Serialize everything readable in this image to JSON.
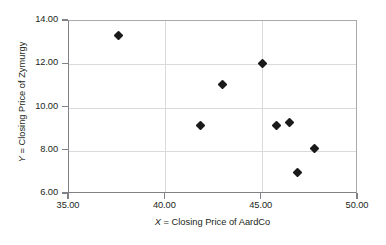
{
  "chart_data": {
    "type": "scatter",
    "title": "",
    "xlabel": "X = Closing Price of AardCo",
    "ylabel": "Y = Closing Price of Zymurgy",
    "xlabel_var": "X",
    "xlabel_rest": " = Closing Price of AardCo",
    "ylabel_var": "Y",
    "ylabel_rest": " = Closing Price of Zymurgy",
    "xlim": [
      35.0,
      50.0
    ],
    "ylim": [
      6.0,
      14.0
    ],
    "xticks": [
      35.0,
      40.0,
      45.0,
      50.0
    ],
    "yticks": [
      6.0,
      8.0,
      10.0,
      12.0,
      14.0
    ],
    "xtick_labels": [
      "35.00",
      "40.00",
      "45.00",
      "50.00"
    ],
    "ytick_labels": [
      "6.00",
      "8.00",
      "10.00",
      "12.00",
      "14.00"
    ],
    "grid": true,
    "grid_axis": "both",
    "legend": false,
    "marker": "diamond",
    "marker_color": "#1a1a1a",
    "grid_color": "#d9dadb",
    "axis_color": "#808285",
    "background": "#ffffff",
    "points": [
      {
        "x": 37.6,
        "y": 13.3
      },
      {
        "x": 41.9,
        "y": 9.1
      },
      {
        "x": 43.0,
        "y": 11.0
      },
      {
        "x": 45.1,
        "y": 12.0
      },
      {
        "x": 45.8,
        "y": 9.1
      },
      {
        "x": 46.5,
        "y": 9.25
      },
      {
        "x": 46.9,
        "y": 6.95
      },
      {
        "x": 47.8,
        "y": 8.05
      }
    ]
  }
}
